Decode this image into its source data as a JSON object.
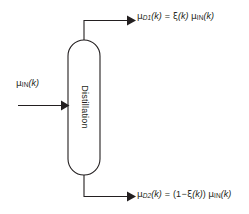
{
  "diagram": {
    "stroke_color": "#231f20",
    "fill_color": "#ffffff",
    "background": "#ffffff",
    "block": {
      "name": "Distillation",
      "label": "Distillation",
      "shape": "stadium",
      "orientation": "vertical",
      "label_rotation_deg": 90
    },
    "flows": [
      {
        "id": "input",
        "direction": "into-block",
        "side": "left",
        "label_plain": "μIN(k)",
        "mu": "μ",
        "subscript": "IN",
        "subscript_italic": false,
        "arg": "(k)"
      },
      {
        "id": "top-output",
        "direction": "out-of-block",
        "side": "top",
        "label_plain": "μD1(k) = ξ(k) μIN(k)",
        "lhs": {
          "mu": "μ",
          "subscript": "D1",
          "subscript_italic": true,
          "arg": "(k)"
        },
        "equals": "=",
        "rhs": {
          "xi": "ξ",
          "xi_arg": "(k)",
          "mu": "μ",
          "subscript": "IN",
          "subscript_italic": false,
          "arg": "(k)"
        }
      },
      {
        "id": "bottom-output",
        "direction": "out-of-block",
        "side": "bottom",
        "label_plain": "μD2(k) = (1 − ξ(k)) μIN(k)",
        "lhs": {
          "mu": "μ",
          "subscript": "D2",
          "subscript_italic": true,
          "arg": "(k)"
        },
        "equals": "=",
        "rhs": {
          "open_paren": "(",
          "one": "1",
          "minus": "−",
          "xi": "ξ",
          "xi_arg": "(k)",
          "close_paren": ")",
          "mu": "μ",
          "subscript": "IN",
          "subscript_italic": false,
          "arg": "(k)"
        }
      }
    ]
  }
}
